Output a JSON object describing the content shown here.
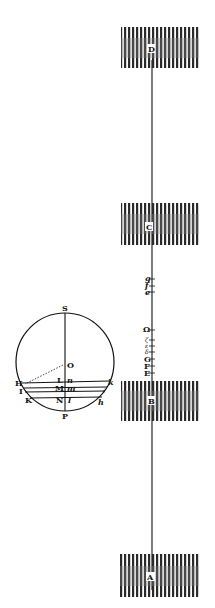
{
  "diagram": {
    "type": "geometric-physics-figure",
    "circle_figure": {
      "labels": {
        "top": "S",
        "center": "O",
        "bottom": "P",
        "left_H": "H",
        "left_I": "I",
        "left_K": "K",
        "chord1_left": "L",
        "chord1_right": "n",
        "chord2_left": "M",
        "chord2_right": "m",
        "chord3_left": "N",
        "chord3_right": "l",
        "right_k": "k",
        "right_i": "i",
        "right_h": "h"
      }
    },
    "column_figure": {
      "blocks": [
        {
          "label": "D"
        },
        {
          "label": "C"
        },
        {
          "label": "B"
        },
        {
          "label": "A"
        }
      ],
      "upper_marks": [
        "g",
        "f",
        "e"
      ],
      "lower_marks": [
        "Ω",
        "ζ",
        "ε",
        "δ",
        "G",
        "F",
        "E"
      ]
    }
  },
  "colors": {
    "ink": "#111111",
    "hatch": "#2a2a2a",
    "paper": "#ffffff"
  }
}
